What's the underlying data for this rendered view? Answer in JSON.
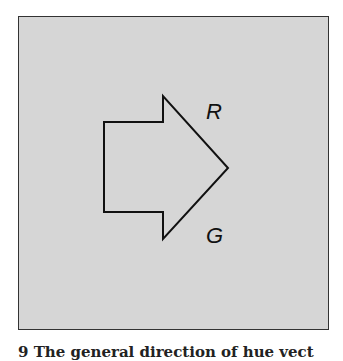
{
  "figure": {
    "labels": {
      "top": "R",
      "bottom": "G"
    },
    "caption": "9   The general direction of hue vect",
    "colors": {
      "panel": "#d6d6d6",
      "stroke": "#111111"
    }
  }
}
